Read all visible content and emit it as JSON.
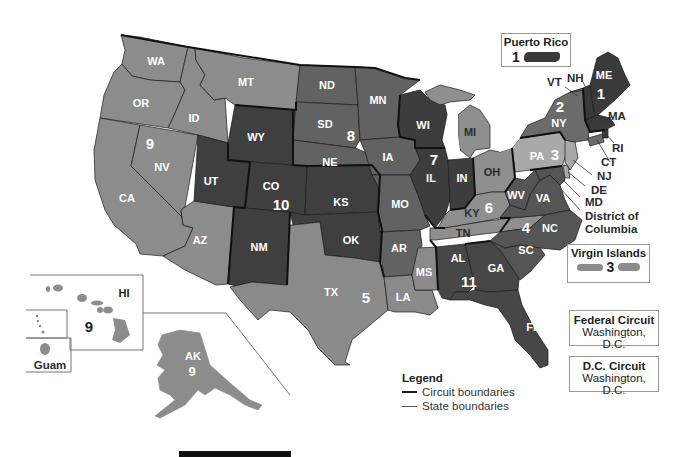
{
  "map": {
    "title": "U.S. Federal Courts of Appeals Circuit Map",
    "colors": {
      "circuit_1": "#3a3a3a",
      "circuit_2": "#6b6b6b",
      "circuit_3": "#a9a9a9",
      "circuit_4": "#555555",
      "circuit_5": "#8a8a8a",
      "circuit_6": "#8f8f8f",
      "circuit_7": "#3d3d3d",
      "circuit_8": "#626262",
      "circuit_9": "#8c8c8c",
      "circuit_10": "#3f3f3f",
      "circuit_11": "#474747"
    },
    "states": [
      {
        "abbr": "WA",
        "circuit": 9
      },
      {
        "abbr": "OR",
        "circuit": 9
      },
      {
        "abbr": "CA",
        "circuit": 9
      },
      {
        "abbr": "NV",
        "circuit": 9
      },
      {
        "abbr": "ID",
        "circuit": 9
      },
      {
        "abbr": "MT",
        "circuit": 9
      },
      {
        "abbr": "AZ",
        "circuit": 9
      },
      {
        "abbr": "AK",
        "circuit": 9
      },
      {
        "abbr": "HI",
        "circuit": 9
      },
      {
        "abbr": "WY",
        "circuit": 10
      },
      {
        "abbr": "UT",
        "circuit": 10
      },
      {
        "abbr": "CO",
        "circuit": 10
      },
      {
        "abbr": "NM",
        "circuit": 10
      },
      {
        "abbr": "KS",
        "circuit": 10
      },
      {
        "abbr": "OK",
        "circuit": 10
      },
      {
        "abbr": "ND",
        "circuit": 8
      },
      {
        "abbr": "SD",
        "circuit": 8
      },
      {
        "abbr": "NE",
        "circuit": 8
      },
      {
        "abbr": "MN",
        "circuit": 8
      },
      {
        "abbr": "IA",
        "circuit": 8
      },
      {
        "abbr": "MO",
        "circuit": 8
      },
      {
        "abbr": "AR",
        "circuit": 8
      },
      {
        "abbr": "TX",
        "circuit": 5
      },
      {
        "abbr": "LA",
        "circuit": 5
      },
      {
        "abbr": "MS",
        "circuit": 5
      },
      {
        "abbr": "WI",
        "circuit": 7
      },
      {
        "abbr": "IL",
        "circuit": 7
      },
      {
        "abbr": "IN",
        "circuit": 7
      },
      {
        "abbr": "MI",
        "circuit": 6
      },
      {
        "abbr": "OH",
        "circuit": 6
      },
      {
        "abbr": "KY",
        "circuit": 6
      },
      {
        "abbr": "TN",
        "circuit": 6
      },
      {
        "abbr": "AL",
        "circuit": 11
      },
      {
        "abbr": "GA",
        "circuit": 11
      },
      {
        "abbr": "FL",
        "circuit": 11
      },
      {
        "abbr": "WV",
        "circuit": 4
      },
      {
        "abbr": "VA",
        "circuit": 4
      },
      {
        "abbr": "NC",
        "circuit": 4
      },
      {
        "abbr": "SC",
        "circuit": 4
      },
      {
        "abbr": "MD",
        "circuit": 4
      },
      {
        "abbr": "PA",
        "circuit": 3
      },
      {
        "abbr": "NJ",
        "circuit": 3
      },
      {
        "abbr": "DE",
        "circuit": 3
      },
      {
        "abbr": "NY",
        "circuit": 2
      },
      {
        "abbr": "VT",
        "circuit": 2
      },
      {
        "abbr": "CT",
        "circuit": 2
      },
      {
        "abbr": "ME",
        "circuit": 1
      },
      {
        "abbr": "NH",
        "circuit": 1
      },
      {
        "abbr": "MA",
        "circuit": 1
      },
      {
        "abbr": "RI",
        "circuit": 1
      }
    ],
    "labels": {
      "WA": "WA",
      "OR": "OR",
      "CA": "CA",
      "NV": "NV",
      "ID": "ID",
      "MT": "MT",
      "AZ": "AZ",
      "WY": "WY",
      "UT": "UT",
      "CO": "CO",
      "NM": "NM",
      "ND": "ND",
      "SD": "SD",
      "NE": "NE",
      "KS": "KS",
      "OK": "OK",
      "TX": "TX",
      "MN": "MN",
      "IA": "IA",
      "MO": "MO",
      "AR": "AR",
      "LA": "LA",
      "WI": "WI",
      "IL": "IL",
      "IN": "IN",
      "MI": "MI",
      "OH": "OH",
      "KY": "KY",
      "TN": "TN",
      "MS": "MS",
      "AL": "AL",
      "GA": "GA",
      "FL": "FL",
      "WV": "WV",
      "VA": "VA",
      "NC": "NC",
      "SC": "SC",
      "PA": "PA",
      "NY": "NY",
      "ME": "ME",
      "AK": "AK",
      "HI": "HI"
    },
    "circuit_numbers": {
      "c1": "1",
      "c2": "2",
      "c3": "3",
      "c4": "4",
      "c5": "5",
      "c6": "6",
      "c7": "7",
      "c8": "8",
      "c9": "9",
      "c9_hi": "9",
      "c9_ak": "9",
      "c10": "10",
      "c11": "11"
    },
    "callouts": {
      "VT": "VT",
      "NH": "NH",
      "MA": "MA",
      "RI": "RI",
      "CT": "CT",
      "NJ": "NJ",
      "DE": "DE",
      "MD": "MD",
      "dc_line1": "District of",
      "dc_line2": "Columbia"
    },
    "insets": {
      "puerto_rico": {
        "title": "Puerto Rico",
        "circuit": "1"
      },
      "virgin_islands": {
        "title": "Virgin Islands",
        "circuit": "3"
      },
      "guam": {
        "title": "Guam"
      },
      "federal_circuit": {
        "title": "Federal Circuit",
        "location": "Washington, D.C."
      },
      "dc_circuit": {
        "title": "D.C. Circuit",
        "location": "Washington, D.C."
      }
    }
  },
  "legend": {
    "title": "Legend",
    "items": [
      {
        "label": "Circuit boundaries",
        "style": "thick",
        "color": "#1a1a1a"
      },
      {
        "label": "State boundaries",
        "style": "thin",
        "color": "#555555"
      }
    ]
  }
}
